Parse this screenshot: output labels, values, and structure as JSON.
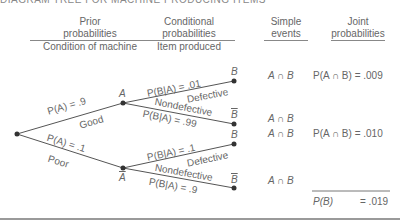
{
  "title": "DIAGRAM TREE FOR MACHINE PRODUCING ITEMS",
  "headers": {
    "prior": {
      "line1": "Prior",
      "line2": "probabilities",
      "line3": "Condition of machine"
    },
    "conditional": {
      "line1": "Conditional",
      "line2": "probabilities",
      "line3": "Item produced"
    },
    "simple": {
      "line1": "Simple",
      "line2": "events"
    },
    "joint": {
      "line1": "Joint",
      "line2": "probabilities"
    }
  },
  "tree": {
    "nodes": {
      "a": "A",
      "abar": "A",
      "b1": "B",
      "bbar1": "B",
      "b2": "B",
      "bbar2": "B"
    },
    "branches": {
      "good": {
        "prob": "P(A) = .9",
        "label": "Good"
      },
      "poor": {
        "prob": "P(A) = .1",
        "label": "Poor"
      },
      "a_def": {
        "prob": "P(B|A) = .01",
        "label": "Defective"
      },
      "a_nondef": {
        "prob": "P(B|A) = .99",
        "label": "Nondefective"
      },
      "abar_def": {
        "prob": "P(B|A) = .1",
        "label": "Defective"
      },
      "abar_nondef": {
        "prob": "P(B|A) = .9",
        "label": "Nondefective"
      }
    }
  },
  "simple_events": [
    "A ∩ B",
    "A ∩ B",
    "A ∩ B",
    "A ∩ B"
  ],
  "joint_probabilities": [
    {
      "expr": "P(A ∩ B) = .009"
    },
    {
      "expr": "P(A ∩ B) = .010"
    }
  ],
  "total": {
    "label": "P(B)",
    "value": "= .019"
  }
}
